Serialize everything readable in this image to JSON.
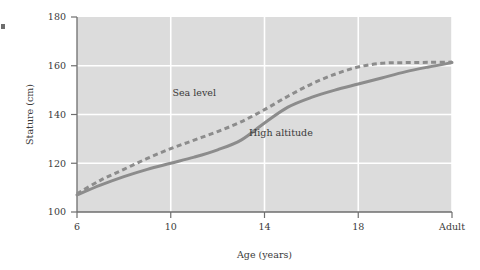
{
  "chart_data": {
    "type": "line",
    "title": "",
    "subtitle": "",
    "xlabel": "Age (years)",
    "ylabel": "Stature (cm)",
    "xlim": [
      6,
      22
    ],
    "ylim": [
      100,
      180
    ],
    "grid": true,
    "grid_color": "#ffffff",
    "plot_background": "#dcdcdc",
    "legend_position": "inline-annotation",
    "x_tick_values": [
      6,
      10,
      14,
      18,
      22
    ],
    "x_tick_labels": [
      "6",
      "10",
      "14",
      "18",
      "Adult"
    ],
    "y_tick_values": [
      100,
      120,
      140,
      160,
      180
    ],
    "y_tick_labels": [
      "100",
      "120",
      "140",
      "160",
      "180"
    ],
    "series": [
      {
        "name": "Sea level",
        "style": "dashed",
        "color": "#8c8c8c",
        "annotation": "Sea level",
        "annotation_x": 11.0,
        "annotation_y": 147.5,
        "x": [
          6,
          7,
          8,
          9,
          10,
          11,
          12,
          13,
          14,
          15,
          16,
          17,
          18,
          19,
          20,
          21,
          22
        ],
        "y": [
          107.5,
          113.0,
          117.5,
          122.0,
          126.0,
          129.5,
          133.0,
          137.0,
          142.0,
          147.5,
          152.5,
          156.5,
          159.5,
          161.0,
          161.3,
          161.4,
          161.5
        ]
      },
      {
        "name": "High altitude",
        "style": "solid",
        "color": "#8c8c8c",
        "annotation": "High altitude",
        "annotation_x": 14.7,
        "annotation_y": 131.0,
        "x": [
          6,
          7,
          8,
          9,
          10,
          11,
          12,
          13,
          14,
          15,
          16,
          17,
          18,
          19,
          20,
          21,
          22
        ],
        "y": [
          107.0,
          111.0,
          114.5,
          117.5,
          120.0,
          122.5,
          125.5,
          129.5,
          136.5,
          143.0,
          147.0,
          150.0,
          152.5,
          155.0,
          157.5,
          159.5,
          161.3
        ]
      }
    ]
  },
  "axes": {
    "x_title": "Age (years)",
    "y_title": "Stature (cm)"
  },
  "colors": {
    "plot_bg": "#dcdcdc",
    "grid": "#ffffff",
    "axis": "#6e6e6e",
    "series": "#8c8c8c",
    "text": "#3a3a3a"
  }
}
